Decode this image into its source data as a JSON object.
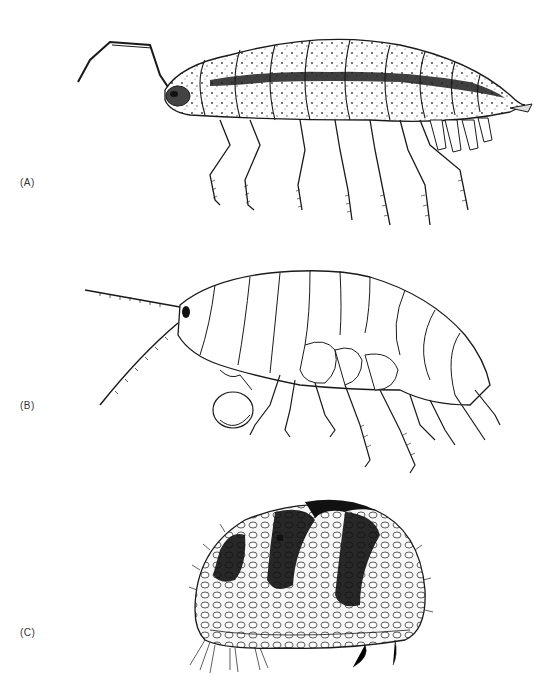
{
  "figure": {
    "panels": [
      {
        "label": "(A)",
        "subject": "isopod"
      },
      {
        "label": "(B)",
        "subject": "amphipod"
      },
      {
        "label": "(C)",
        "subject": "ostracod"
      }
    ]
  },
  "colors": {
    "ink": "#1a1a1a",
    "paper": "#ffffff",
    "shade": "#2b2b2b"
  }
}
